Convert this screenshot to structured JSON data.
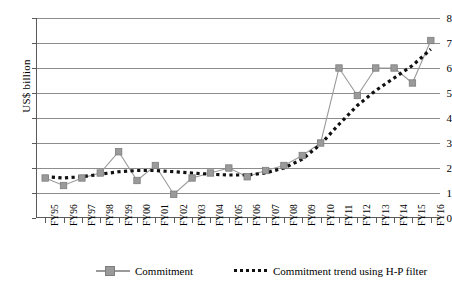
{
  "chart_data": {
    "type": "line",
    "title": "",
    "xlabel": "",
    "ylabel": "US$ billion",
    "ylim": [
      0,
      8
    ],
    "ytick_labels": [
      "0",
      "1",
      "2",
      "3",
      "4",
      "5",
      "6",
      "7",
      "8"
    ],
    "grid": true,
    "legend_position": "bottom",
    "categories": [
      "FY95",
      "FY96",
      "FY97",
      "FY98",
      "FY99",
      "FY00",
      "FY01",
      "FY02",
      "FY03",
      "FY04",
      "FY05",
      "FY06",
      "FY07",
      "FY08",
      "FY09",
      "FY10",
      "FY11",
      "FY12",
      "FY13",
      "FY14",
      "FY15",
      "FY16"
    ],
    "series": [
      {
        "name": "Commitment",
        "marker": "square",
        "color": "#9a9a9a",
        "values": [
          1.6,
          1.3,
          1.6,
          1.8,
          2.65,
          1.5,
          2.1,
          0.95,
          1.6,
          1.8,
          2.0,
          1.65,
          1.9,
          2.1,
          2.5,
          3.0,
          6.0,
          4.9,
          6.0,
          6.0,
          5.4,
          7.1
        ]
      },
      {
        "name": "Commitment trend using H-P filter",
        "marker": "none",
        "color": "#111111",
        "style": "dotted",
        "values": [
          1.65,
          1.6,
          1.65,
          1.75,
          1.85,
          1.9,
          1.9,
          1.85,
          1.8,
          1.75,
          1.72,
          1.72,
          1.8,
          2.0,
          2.35,
          2.95,
          3.75,
          4.5,
          5.1,
          5.6,
          6.1,
          6.75
        ]
      }
    ]
  },
  "legend": {
    "items": [
      {
        "label": "Commitment",
        "key": "line-square-marker-gray"
      },
      {
        "label": "Commitment trend using H-P filter",
        "key": "dotted-line-black"
      }
    ]
  },
  "colors": {
    "series_commitment": "#9a9a9a",
    "series_trend": "#111111",
    "gridline": "#8d8d8d",
    "axis": "#5a5a5a",
    "background": "#ffffff"
  }
}
